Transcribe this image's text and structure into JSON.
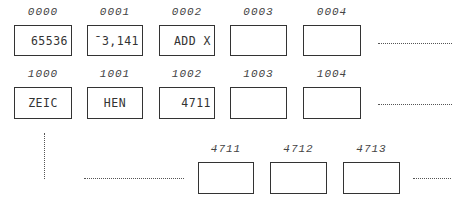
{
  "rows": [
    {
      "cells": [
        {
          "address": "0000",
          "value": "65536"
        },
        {
          "address": "0001",
          "value": "ˉ3,141"
        },
        {
          "address": "0002",
          "value": "ADD X"
        },
        {
          "address": "0003",
          "value": ""
        },
        {
          "address": "0004",
          "value": ""
        }
      ],
      "continuation": ". . . . . . . . . . . ."
    },
    {
      "cells": [
        {
          "address": "1000",
          "value": "ZEIC"
        },
        {
          "address": "1001",
          "value": "HEN"
        },
        {
          "address": "1002",
          "value": "4711"
        },
        {
          "address": "1003",
          "value": ""
        },
        {
          "address": "1004",
          "value": ""
        }
      ],
      "continuation": ". . . . . . . . . . . ."
    },
    {
      "cells": [
        {
          "address": "4711",
          "value": ""
        },
        {
          "address": "4712",
          "value": ""
        },
        {
          "address": "4713",
          "value": ""
        }
      ],
      "continuation": ". . . . . ."
    }
  ]
}
